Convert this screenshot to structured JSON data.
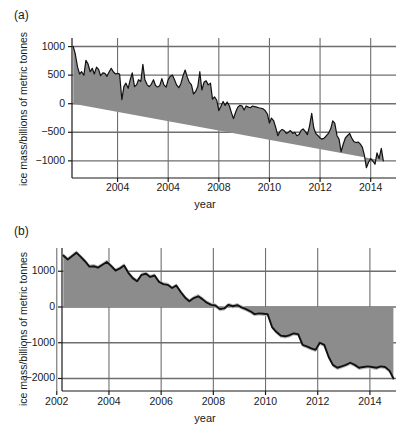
{
  "figure": {
    "panels": [
      {
        "id": "a",
        "label": "(a)",
        "xlabel": "year",
        "ylabel": "ice mass/billions of metric tonnes",
        "xticks": [
          "2004",
          "2004",
          "2008",
          "2010",
          "2012",
          "2014"
        ],
        "yticks": [
          "1000",
          "500",
          "0",
          "-500",
          "-1000"
        ]
      },
      {
        "id": "b",
        "label": "(b)",
        "xlabel": "year",
        "ylabel": "ice mass/billions of metric tonnes",
        "xticks": [
          "2002",
          "2004",
          "2006",
          "2008",
          "2010",
          "2012",
          "2014"
        ],
        "yticks": [
          "1000",
          "0",
          "-1000",
          "-2000"
        ]
      }
    ]
  },
  "colors": {
    "fill_grey": "#8c8c8c",
    "band_grey": "#bdbdbd",
    "line_black": "#111111",
    "grid_grey": "#6e6e6e",
    "axis_black": "#1a1a1a",
    "background": "#ffffff"
  },
  "chart_data": [
    {
      "type": "area",
      "title": "(a)",
      "xlabel": "year",
      "ylabel": "ice mass/billions of metric tonnes",
      "xlim": [
        2002.2,
        2015.0
      ],
      "ylim": [
        -1300,
        1150
      ],
      "xticks": [
        2004,
        2006,
        2008,
        2010,
        2012,
        2014
      ],
      "xticklabels": [
        "2004",
        "2004",
        "2008",
        "2010",
        "2012",
        "2014"
      ],
      "yticks": [
        1000,
        500,
        0,
        -500,
        -1000
      ],
      "grid": true,
      "legend": null,
      "zero_reference": 0,
      "series": [
        {
          "name": "ice mass anomaly",
          "x": [
            2002.25,
            2002.33,
            2002.42,
            2002.5,
            2002.58,
            2002.67,
            2002.75,
            2002.83,
            2002.92,
            2003.0,
            2003.08,
            2003.17,
            2003.25,
            2003.33,
            2003.42,
            2003.5,
            2003.58,
            2003.67,
            2003.75,
            2003.83,
            2003.92,
            2004.0,
            2004.08,
            2004.17,
            2004.25,
            2004.33,
            2004.42,
            2004.5,
            2004.58,
            2004.67,
            2004.75,
            2004.83,
            2004.92,
            2005.0,
            2005.08,
            2005.17,
            2005.25,
            2005.33,
            2005.42,
            2005.5,
            2005.58,
            2005.67,
            2005.75,
            2005.83,
            2005.92,
            2006.0,
            2006.08,
            2006.17,
            2006.25,
            2006.33,
            2006.42,
            2006.5,
            2006.58,
            2006.67,
            2006.75,
            2006.83,
            2006.92,
            2007.0,
            2007.08,
            2007.17,
            2007.25,
            2007.33,
            2007.42,
            2007.5,
            2007.58,
            2007.67,
            2007.75,
            2007.83,
            2007.92,
            2008.0,
            2008.08,
            2008.17,
            2008.25,
            2008.33,
            2008.42,
            2008.5,
            2008.58,
            2008.67,
            2008.75,
            2008.83,
            2008.92,
            2009.0,
            2009.08,
            2009.17,
            2009.25,
            2009.33,
            2009.42,
            2009.5,
            2009.58,
            2009.67,
            2009.75,
            2009.83,
            2009.92,
            2010.0,
            2010.08,
            2010.17,
            2010.25,
            2010.33,
            2010.42,
            2010.5,
            2010.58,
            2010.67,
            2010.75,
            2010.83,
            2010.92,
            2011.0,
            2011.08,
            2011.17,
            2011.25,
            2011.33,
            2011.42,
            2011.5,
            2011.58,
            2011.67,
            2011.75,
            2011.83,
            2011.92,
            2012.0,
            2012.08,
            2012.17,
            2012.25,
            2012.33,
            2012.42,
            2012.5,
            2012.58,
            2012.67,
            2012.75,
            2012.83,
            2012.92,
            2013.0,
            2013.08,
            2013.17,
            2013.25,
            2013.33,
            2013.42,
            2013.5,
            2013.58,
            2013.67,
            2013.75,
            2013.83,
            2013.92,
            2014.0,
            2014.08,
            2014.17,
            2014.25,
            2014.33,
            2014.42,
            2014.5,
            2014.58,
            2014.67,
            2014.75,
            2014.83
          ],
          "values": [
            1000,
            870,
            640,
            520,
            560,
            500,
            760,
            700,
            560,
            620,
            520,
            640,
            600,
            490,
            540,
            530,
            480,
            560,
            620,
            560,
            520,
            530,
            520,
            70,
            300,
            360,
            270,
            420,
            540,
            300,
            330,
            420,
            390,
            690,
            420,
            330,
            300,
            340,
            420,
            320,
            290,
            320,
            440,
            330,
            290,
            420,
            480,
            500,
            420,
            330,
            280,
            350,
            480,
            590,
            470,
            380,
            330,
            170,
            210,
            300,
            560,
            240,
            380,
            400,
            330,
            360,
            80,
            120,
            60,
            -120,
            -50,
            40,
            -30,
            30,
            -40,
            -160,
            -260,
            -140,
            -60,
            -30,
            -40,
            -110,
            -40,
            -60,
            -70,
            -40,
            -50,
            -60,
            -70,
            -80,
            -90,
            -120,
            -180,
            -340,
            -250,
            -300,
            -420,
            -560,
            -480,
            -450,
            -470,
            -520,
            -500,
            -470,
            -520,
            -500,
            -560,
            -540,
            -470,
            -440,
            -490,
            -540,
            -400,
            -170,
            -420,
            -520,
            -560,
            -600,
            -620,
            -600,
            -560,
            -520,
            -440,
            -300,
            -340,
            -560,
            -620,
            -840,
            -700,
            -600,
            -560,
            -520,
            -600,
            -660,
            -680,
            -670,
            -700,
            -760,
            -900,
            -1120,
            -1020,
            -960,
            -1000,
            -1060,
            -860,
            -960,
            -780,
            -1000
          ],
          "units": "Gt"
        }
      ]
    },
    {
      "type": "area",
      "title": "(b)",
      "xlabel": "year",
      "ylabel": "ice mass/billions of metric tonnes",
      "xlim": [
        2002.2,
        2015.0
      ],
      "ylim": [
        -2350,
        1650
      ],
      "xticks": [
        2002,
        2004,
        2006,
        2008,
        2010,
        2012,
        2014
      ],
      "xticklabels": [
        "2002",
        "2004",
        "2006",
        "2008",
        "2010",
        "2012",
        "2014"
      ],
      "yticks": [
        1000,
        0,
        -1000,
        -2000
      ],
      "grid": true,
      "legend": null,
      "zero_reference": 0,
      "series": [
        {
          "name": "ice mass anomaly",
          "x": [
            2002.25,
            2002.42,
            2002.58,
            2002.75,
            2002.92,
            2003.08,
            2003.25,
            2003.42,
            2003.58,
            2003.75,
            2003.92,
            2004.08,
            2004.25,
            2004.42,
            2004.58,
            2004.75,
            2004.92,
            2005.08,
            2005.25,
            2005.42,
            2005.58,
            2005.75,
            2005.92,
            2006.08,
            2006.25,
            2006.42,
            2006.58,
            2006.75,
            2006.92,
            2007.08,
            2007.25,
            2007.42,
            2007.58,
            2007.75,
            2007.92,
            2008.08,
            2008.25,
            2008.42,
            2008.58,
            2008.75,
            2008.92,
            2009.08,
            2009.25,
            2009.42,
            2009.58,
            2009.75,
            2009.92,
            2010.08,
            2010.25,
            2010.42,
            2010.58,
            2010.75,
            2010.92,
            2011.08,
            2011.25,
            2011.42,
            2011.58,
            2011.75,
            2011.92,
            2012.08,
            2012.25,
            2012.42,
            2012.58,
            2012.75,
            2012.92,
            2013.08,
            2013.25,
            2013.42,
            2013.58,
            2013.75,
            2013.92,
            2014.08,
            2014.25,
            2014.42,
            2014.58,
            2014.75,
            2014.9
          ],
          "values": [
            1440,
            1330,
            1420,
            1520,
            1400,
            1280,
            1130,
            1140,
            1100,
            1180,
            1260,
            1150,
            1020,
            1080,
            1160,
            950,
            800,
            720,
            900,
            930,
            840,
            880,
            700,
            640,
            620,
            530,
            600,
            420,
            260,
            160,
            250,
            300,
            220,
            120,
            60,
            40,
            -60,
            -40,
            60,
            20,
            50,
            -10,
            -60,
            -120,
            -200,
            -180,
            -190,
            -200,
            -560,
            -700,
            -800,
            -820,
            -790,
            -740,
            -760,
            -1060,
            -1100,
            -1160,
            -1200,
            -1000,
            -1060,
            -1400,
            -1620,
            -1700,
            -1660,
            -1620,
            -1560,
            -1620,
            -1700,
            -1680,
            -1660,
            -1680,
            -1700,
            -1660,
            -1680,
            -1780,
            -2000
          ],
          "uncertainty_band_offset": 60,
          "units": "Gt"
        }
      ]
    }
  ]
}
